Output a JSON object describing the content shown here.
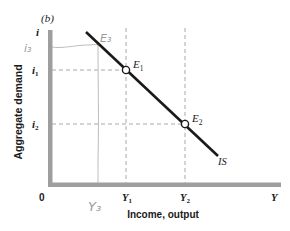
{
  "panel_label": "(b)",
  "axes": {
    "y_axis_symbol": "i",
    "x_axis_symbol": "Y",
    "origin_label": "0",
    "y_axis_title": "Aggregate demand",
    "x_axis_title": "Income, output",
    "axis_color": "#9e9e9e"
  },
  "curve": {
    "label": "IS",
    "color": "#1a1a1a"
  },
  "points": [
    {
      "label": "E",
      "sub": "1",
      "y_tick": "i",
      "y_sub": "1",
      "x_tick": "Y",
      "x_sub": "1"
    },
    {
      "label": "E",
      "sub": "2",
      "y_tick": "i",
      "y_sub": "2",
      "x_tick": "Y",
      "x_sub": "2"
    }
  ],
  "annotations": {
    "handwritten_i3": "i₃",
    "handwritten_E3": "E₃",
    "handwritten_Y3": "Y₃",
    "color": "#9a9a9a"
  },
  "guide_line_color": "#b0b0b0"
}
